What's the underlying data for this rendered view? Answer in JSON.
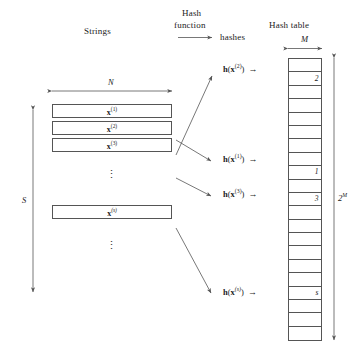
{
  "figure": {
    "title_strings": "Strings",
    "title_hashfn_line1": "Hash",
    "title_hashfn_line2": "function",
    "title_hashes": "hashes",
    "title_hashtable": "Hash table",
    "dim_N": "N",
    "dim_S": "S",
    "dim_M": "M",
    "dim_2M_base": "2",
    "dim_2M_exp": "M",
    "vdots_glyph": "⋮",
    "arrow_glyph": "→"
  },
  "strings": {
    "boxes": [
      {
        "id": "x1",
        "base": "x",
        "sup": "(1)"
      },
      {
        "id": "x2",
        "base": "x",
        "sup": "(2)"
      },
      {
        "id": "x3",
        "base": "x",
        "sup": "(3)"
      },
      {
        "id": "xs",
        "base": "x",
        "sup": "(s)"
      }
    ]
  },
  "hashes": {
    "labels": [
      {
        "id": "hx2",
        "fn": "h",
        "base": "x",
        "sup": "(2)",
        "arrow": "→"
      },
      {
        "id": "hx1",
        "fn": "h",
        "base": "x",
        "sup": "(1)",
        "arrow": "→"
      },
      {
        "id": "hx3",
        "fn": "h",
        "base": "x",
        "sup": "(3)",
        "arrow": "→"
      },
      {
        "id": "hxs",
        "fn": "h",
        "base": "x",
        "sup": "(s)",
        "arrow": "→"
      }
    ]
  },
  "hash_table": {
    "cell_count": 21,
    "filled": [
      {
        "index": 1,
        "value": "2"
      },
      {
        "index": 8,
        "value": "1"
      },
      {
        "index": 10,
        "value": "3"
      },
      {
        "index": 17,
        "value": "s"
      }
    ]
  },
  "colors": {
    "stroke": "#555555",
    "text": "#1a1a1a",
    "background": "#ffffff"
  }
}
